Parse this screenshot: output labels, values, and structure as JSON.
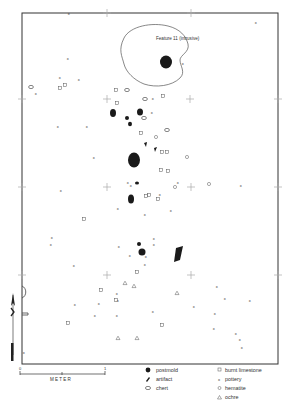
{
  "map": {
    "feature_label": "Feature 11 (intrusive)",
    "scale": {
      "start_label": "0",
      "end_label": "1",
      "unit_label": "METER"
    },
    "north_arrow_label": "N",
    "colors": {
      "ink": "#1a1a1a",
      "paper": "#ffffff",
      "grid": "#999999"
    }
  },
  "legend": {
    "left": [
      {
        "icon": "postmold-icon",
        "label": "postmold"
      },
      {
        "icon": "artifact-icon",
        "label": "artifact"
      },
      {
        "icon": "chert-icon",
        "label": "chert"
      }
    ],
    "right": [
      {
        "icon": "burnt-limestone-icon",
        "label": "burnt limestone"
      },
      {
        "icon": "pottery-icon",
        "label": "pottery"
      },
      {
        "icon": "hematite-icon",
        "label": "hematite"
      },
      {
        "icon": "ochre-icon",
        "label": "ochre"
      }
    ]
  },
  "symbols": {
    "pottery": [
      [
        69,
        13
      ],
      [
        256,
        22
      ],
      [
        68,
        58
      ],
      [
        60,
        77
      ],
      [
        79,
        79
      ],
      [
        36,
        93
      ],
      [
        58,
        126
      ],
      [
        87,
        126
      ],
      [
        183,
        63
      ],
      [
        153,
        98
      ],
      [
        152,
        112
      ],
      [
        94,
        157
      ],
      [
        61,
        190
      ],
      [
        128,
        182
      ],
      [
        131,
        185
      ],
      [
        241,
        185
      ],
      [
        52,
        237
      ],
      [
        51,
        244
      ],
      [
        178,
        182
      ],
      [
        160,
        194
      ],
      [
        171,
        210
      ],
      [
        118,
        208
      ],
      [
        145,
        214
      ],
      [
        154,
        238
      ],
      [
        154,
        244
      ],
      [
        119,
        246
      ],
      [
        130,
        255
      ],
      [
        146,
        256
      ],
      [
        145,
        264
      ],
      [
        74,
        265
      ],
      [
        75,
        304
      ],
      [
        117,
        293
      ],
      [
        118,
        300
      ],
      [
        99,
        303
      ],
      [
        95,
        315
      ],
      [
        117,
        315
      ],
      [
        153,
        311
      ],
      [
        217,
        286
      ],
      [
        225,
        298
      ],
      [
        250,
        300
      ],
      [
        194,
        306
      ],
      [
        215,
        313
      ],
      [
        214,
        328
      ],
      [
        236,
        333
      ],
      [
        240,
        339
      ],
      [
        242,
        347
      ],
      [
        24,
        352
      ]
    ],
    "burnt_limestone": [
      [
        60,
        88
      ],
      [
        65,
        85
      ],
      [
        116,
        90
      ],
      [
        117,
        103
      ],
      [
        163,
        96
      ],
      [
        141,
        133
      ],
      [
        162,
        152
      ],
      [
        167,
        152
      ],
      [
        161,
        170
      ],
      [
        168,
        171
      ],
      [
        149,
        195
      ],
      [
        158,
        199
      ],
      [
        146,
        196
      ],
      [
        84,
        219
      ],
      [
        137,
        272
      ],
      [
        101,
        290
      ],
      [
        68,
        323
      ],
      [
        116,
        300
      ],
      [
        162,
        325
      ]
    ],
    "hematite": [
      [
        187,
        157
      ],
      [
        156,
        137
      ],
      [
        209,
        184
      ],
      [
        175,
        187
      ]
    ],
    "ochre": [
      [
        134,
        286
      ],
      [
        177,
        293
      ],
      [
        125,
        283
      ],
      [
        137,
        338
      ],
      [
        118,
        338
      ]
    ],
    "chert": [
      [
        31,
        87
      ],
      [
        127,
        90
      ],
      [
        145,
        99
      ],
      [
        167,
        130
      ],
      [
        144,
        118
      ]
    ],
    "crosses": [
      [
        107,
        99
      ],
      [
        190,
        99
      ],
      [
        107,
        187
      ],
      [
        191,
        187
      ],
      [
        107,
        275
      ],
      [
        191,
        275
      ],
      [
        22,
        99
      ],
      [
        22,
        187
      ],
      [
        278,
        187
      ],
      [
        278,
        99
      ],
      [
        22,
        275
      ],
      [
        278,
        275
      ],
      [
        107,
        13
      ],
      [
        191,
        13
      ]
    ]
  }
}
